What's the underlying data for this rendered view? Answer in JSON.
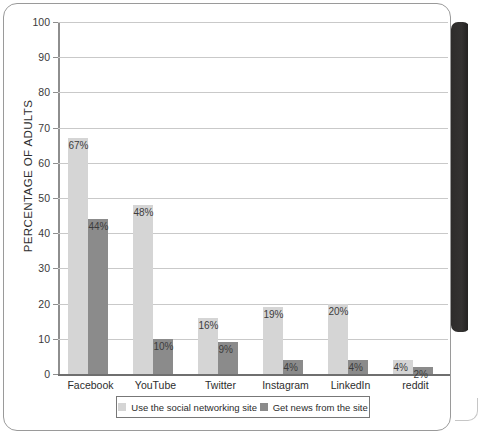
{
  "chart_data": {
    "type": "bar",
    "title": "",
    "xlabel": "",
    "ylabel": "PERCENTAGE OF ADULTS",
    "ylim": [
      0,
      100
    ],
    "yticks": [
      0,
      10,
      20,
      30,
      40,
      50,
      60,
      70,
      80,
      90,
      100
    ],
    "ytick_labels": [
      "0",
      "10",
      "20",
      "30",
      "40",
      "50",
      "60",
      "70",
      "80",
      "90",
      "100"
    ],
    "grid": true,
    "legend_position": "bottom",
    "categories": [
      "Facebook",
      "YouTube",
      "Twitter",
      "Instagram",
      "LinkedIn",
      "reddit"
    ],
    "series": [
      {
        "name": "Use the social networking site",
        "color": "#d5d5d5",
        "values": [
          67,
          48,
          16,
          19,
          20,
          4
        ],
        "labels": [
          "67%",
          "48%",
          "16%",
          "19%",
          "20%",
          "4%"
        ]
      },
      {
        "name": "Get news from the site",
        "color": "#8b8b8b",
        "values": [
          44,
          10,
          9,
          4,
          4,
          2
        ],
        "labels": [
          "44%",
          "10%",
          "9%",
          "4%",
          "4%",
          "2%"
        ]
      }
    ]
  },
  "legend": {
    "items": [
      {
        "label": "Use the social networking site",
        "swatch": "use"
      },
      {
        "label": "Get news from the site",
        "swatch": "news"
      }
    ]
  },
  "colors": {
    "series_light": "#d5d5d5",
    "series_dark": "#8b8b8b",
    "gridline": "#c9c9c9",
    "axis": "#6f6f6f",
    "binding_shadow": "#2e2c2b"
  }
}
